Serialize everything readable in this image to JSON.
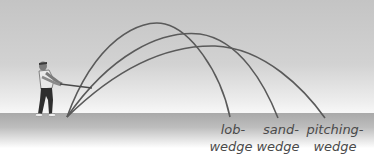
{
  "diagram": {
    "title": "",
    "colors": {
      "arc": "#5a5a5a",
      "sky_top": "#c4c4c4",
      "ground": "#a9a9a9",
      "label": "#4a4a4a"
    },
    "figure": "golfer-swing-icon",
    "trajectories": [
      {
        "club": "lob-wedge",
        "line1": "lob-",
        "line2": "wedge"
      },
      {
        "club": "sand-wedge",
        "line1": "sand-",
        "line2": "wedge"
      },
      {
        "club": "pitching-wedge",
        "line1": "pitching-",
        "line2": "wedge"
      }
    ]
  }
}
